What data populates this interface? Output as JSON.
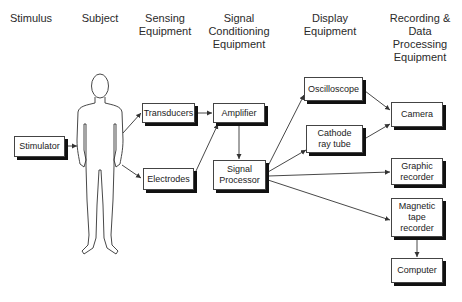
{
  "headers": [
    {
      "id": "stimulus",
      "label": "Stimulus"
    },
    {
      "id": "subject",
      "label": "Subject"
    },
    {
      "id": "sensing",
      "label": "Sensing\nEquipment"
    },
    {
      "id": "conditioning",
      "label": "Signal\nConditioning\nEquipment"
    },
    {
      "id": "display",
      "label": "Display\nEquipment"
    },
    {
      "id": "recording",
      "label": "Recording &\nData\nProcessing\nEquipment"
    }
  ],
  "subject": {
    "figure": "human-body-outline"
  },
  "blocks": {
    "stimulator": {
      "label": "Stimulator"
    },
    "transducers": {
      "label": "Transducers"
    },
    "electrodes": {
      "label": "Electrodes"
    },
    "amplifier": {
      "label": "Amplifier"
    },
    "signal_processor": {
      "label": "Signal\nProcessor"
    },
    "oscilloscope": {
      "label": "Oscilloscope"
    },
    "crt": {
      "label": "Cathode\nray tube"
    },
    "camera": {
      "label": "Camera"
    },
    "graphic_recorder": {
      "label": "Graphic\nrecorder"
    },
    "tape_recorder": {
      "label": "Magnetic\ntape\nrecorder"
    },
    "computer": {
      "label": "Computer"
    }
  },
  "connections": [
    [
      "stimulator",
      "subject"
    ],
    [
      "subject",
      "transducers"
    ],
    [
      "subject",
      "electrodes"
    ],
    [
      "transducers",
      "amplifier"
    ],
    [
      "electrodes",
      "amplifier"
    ],
    [
      "amplifier",
      "signal_processor"
    ],
    [
      "signal_processor",
      "oscilloscope"
    ],
    [
      "signal_processor",
      "crt"
    ],
    [
      "signal_processor",
      "graphic_recorder"
    ],
    [
      "signal_processor",
      "tape_recorder"
    ],
    [
      "oscilloscope",
      "camera"
    ],
    [
      "crt",
      "camera"
    ],
    [
      "tape_recorder",
      "computer"
    ]
  ]
}
